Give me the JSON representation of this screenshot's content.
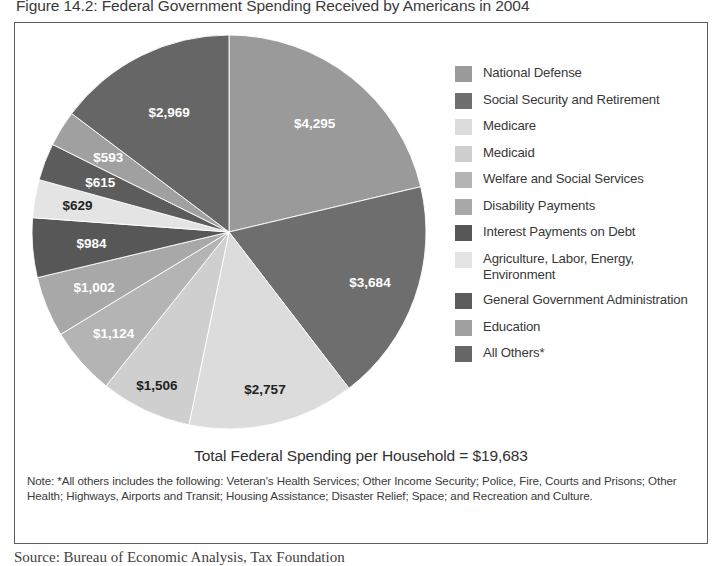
{
  "figure": {
    "title": "Figure 14.2: Federal Government Spending Received by Americans in 2004",
    "total_line": "Total Federal Spending per Household = $19,683",
    "note": "Note: *All others includes the following: Veteran's Health Services; Other Income Security; Police, Fire, Courts and Prisons; Other Health; Highways, Airports and Transit; Housing Assistance; Disaster Relief; Space; and Recreation and Culture.",
    "source": "Source: Bureau of Economic Analysis, Tax Foundation"
  },
  "legend": {
    "items": [
      {
        "label": "National Defense",
        "color": "#9a9a9a"
      },
      {
        "label": "Social Security and Retirement",
        "color": "#6e6e6e"
      },
      {
        "label": "Medicare",
        "color": "#dcdcdc"
      },
      {
        "label": "Medicaid",
        "color": "#cfcfcf"
      },
      {
        "label": "Welfare and Social Services",
        "color": "#b4b4b4"
      },
      {
        "label": "Disability Payments",
        "color": "#a8a8a8"
      },
      {
        "label": "Interest Payments on Debt",
        "color": "#575757"
      },
      {
        "label": "Agriculture, Labor, Energy, Environment",
        "color": "#e4e4e4"
      },
      {
        "label": "General Government Administration",
        "color": "#5c5c5c"
      },
      {
        "label": "Education",
        "color": "#a0a0a0"
      },
      {
        "label": "All Others*",
        "color": "#666666"
      }
    ]
  },
  "chart_data": {
    "type": "pie",
    "title": "Figure 14.2: Federal Government Spending Received by Americans in 2004",
    "unit": "dollars per household",
    "total": 19683,
    "total_label": "Total Federal Spending per Household = $19,683",
    "start_angle_deg": 0,
    "direction": "clockwise",
    "legend_position": "right",
    "labels": [
      "National Defense",
      "Social Security and Retirement",
      "Medicare",
      "Medicaid",
      "Welfare and Social Services",
      "Disability Payments",
      "Interest Payments on Debt",
      "Agriculture, Labor, Energy, Environment",
      "General Government Administration",
      "Education",
      "All Others*"
    ],
    "values": [
      4295,
      3684,
      2757,
      1506,
      1124,
      1002,
      984,
      629,
      615,
      593,
      2969
    ],
    "value_labels": [
      "$4,295",
      "$3,684",
      "$2,757",
      "$1,506",
      "$1,124",
      "$1,002",
      "$984",
      "$629",
      "$615",
      "$593",
      "$2,969"
    ],
    "colors": [
      "#9a9a9a",
      "#6e6e6e",
      "#dcdcdc",
      "#cfcfcf",
      "#b4b4b4",
      "#a8a8a8",
      "#575757",
      "#e4e4e4",
      "#5c5c5c",
      "#a0a0a0",
      "#666666"
    ],
    "label_text_colors": [
      "#ffffff",
      "#ffffff",
      "#1f1f1f",
      "#1f1f1f",
      "#ffffff",
      "#ffffff",
      "#ffffff",
      "#1f1f1f",
      "#ffffff",
      "#ffffff",
      "#ffffff"
    ],
    "label_radius_frac": [
      0.7,
      0.76,
      0.82,
      0.86,
      0.78,
      0.74,
      0.7,
      0.78,
      0.7,
      0.72,
      0.68
    ]
  }
}
